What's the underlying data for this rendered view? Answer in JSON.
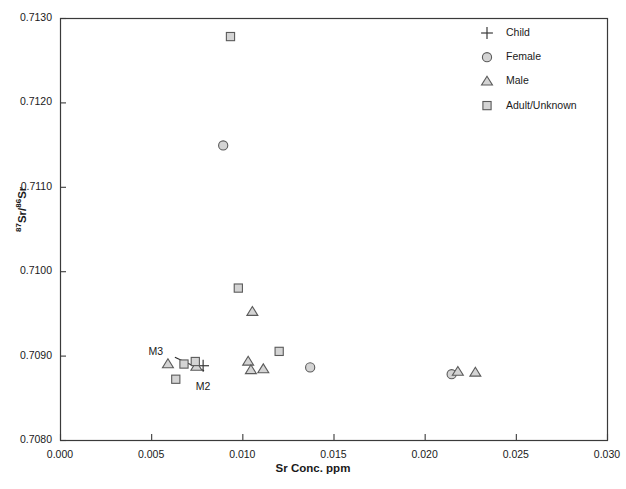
{
  "chart_data": {
    "type": "scatter",
    "title": "",
    "xlabel": "Sr Conc. ppm",
    "ylabel": "87Sr/86Sr",
    "ylabel_parts": {
      "sup1": "87",
      "mid": "Sr/",
      "sup2": "86",
      "tail": "Sr"
    },
    "xlim": [
      0.0,
      0.03
    ],
    "ylim": [
      0.708,
      0.713
    ],
    "xticks": [
      "0.000",
      "0.005",
      "0.010",
      "0.015",
      "0.020",
      "0.025",
      "0.030"
    ],
    "xtick_values": [
      0.0,
      0.005,
      0.01,
      0.015,
      0.02,
      0.025,
      0.03
    ],
    "yticks": [
      "0.7080",
      "0.7090",
      "0.7100",
      "0.7110",
      "0.7120",
      "0.7130"
    ],
    "ytick_values": [
      0.708,
      0.709,
      0.71,
      0.711,
      0.712,
      0.713
    ],
    "grid": false,
    "legend_position": "top-right",
    "legend": [
      {
        "label": "Child",
        "marker": "plus"
      },
      {
        "label": "Female",
        "marker": "circle"
      },
      {
        "label": "Male",
        "marker": "triangle"
      },
      {
        "label": "Adult/Unknown",
        "marker": "square"
      }
    ],
    "marker_fill": "#d4d4d4",
    "marker_stroke": "#5a5a5a",
    "series": [
      {
        "name": "Child",
        "marker": "plus",
        "points": [
          {
            "x": 0.00785,
            "y": 0.70888
          }
        ]
      },
      {
        "name": "Female",
        "marker": "circle",
        "points": [
          {
            "x": 0.00895,
            "y": 0.71149
          },
          {
            "x": 0.01372,
            "y": 0.70886
          },
          {
            "x": 0.02148,
            "y": 0.70878
          }
        ]
      },
      {
        "name": "Male",
        "marker": "triangle",
        "points": [
          {
            "x": 0.00592,
            "y": 0.7089
          },
          {
            "x": 0.00748,
            "y": 0.70887
          },
          {
            "x": 0.01032,
            "y": 0.70893
          },
          {
            "x": 0.01047,
            "y": 0.70883
          },
          {
            "x": 0.01115,
            "y": 0.70884
          },
          {
            "x": 0.01055,
            "y": 0.70952
          },
          {
            "x": 0.02182,
            "y": 0.70881
          },
          {
            "x": 0.02278,
            "y": 0.7088
          }
        ]
      },
      {
        "name": "Adult/Unknown",
        "marker": "square",
        "points": [
          {
            "x": 0.00935,
            "y": 0.71278
          },
          {
            "x": 0.00978,
            "y": 0.7098
          },
          {
            "x": 0.0068,
            "y": 0.7089
          },
          {
            "x": 0.00742,
            "y": 0.70893
          },
          {
            "x": 0.00635,
            "y": 0.70872
          },
          {
            "x": 0.01202,
            "y": 0.70905
          }
        ]
      }
    ],
    "annotations": [
      {
        "text": "M3",
        "x": 0.0054,
        "y": 0.70903
      },
      {
        "text": "M2",
        "x": 0.008,
        "y": 0.70862
      }
    ],
    "connector_line": {
      "from": {
        "x": 0.0063,
        "y": 0.70898
      },
      "to": {
        "x": 0.0079,
        "y": 0.70882
      }
    }
  }
}
